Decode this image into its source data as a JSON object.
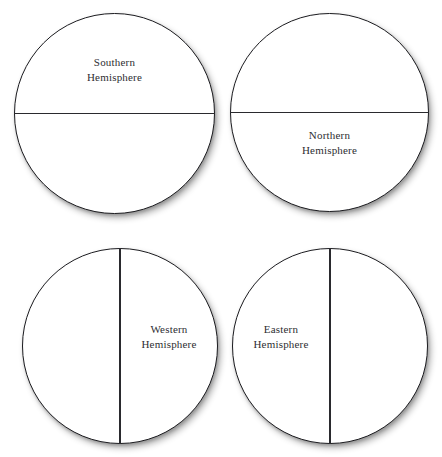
{
  "page": {
    "background_color": "#ffffff",
    "outline_color": "#1b1b1f",
    "line_color": "#2a2a2e",
    "text_color": "#2e2e32"
  },
  "diagram": {
    "type": "hemisphere-diagram",
    "circle_count": 4,
    "layout": "2x2-grid",
    "circles": [
      {
        "id": "southern",
        "divider": "horizontal",
        "label_half": "top",
        "label_line_1": "Southern",
        "label_line_2": "Hemisphere",
        "x": 14,
        "y": 13,
        "size": 201
      },
      {
        "id": "northern",
        "divider": "horizontal",
        "label_half": "bottom",
        "label_line_1": "Northern",
        "label_line_2": "Hemisphere",
        "x": 230,
        "y": 13,
        "size": 199
      },
      {
        "id": "western",
        "divider": "vertical",
        "label_half": "right",
        "label_line_1": "Western",
        "label_line_2": "Hemisphere",
        "x": 22,
        "y": 248,
        "size": 196
      },
      {
        "id": "eastern",
        "divider": "vertical",
        "label_half": "left",
        "label_line_1": "Eastern",
        "label_line_2": "Hemisphere",
        "x": 232,
        "y": 248,
        "size": 196
      }
    ]
  }
}
